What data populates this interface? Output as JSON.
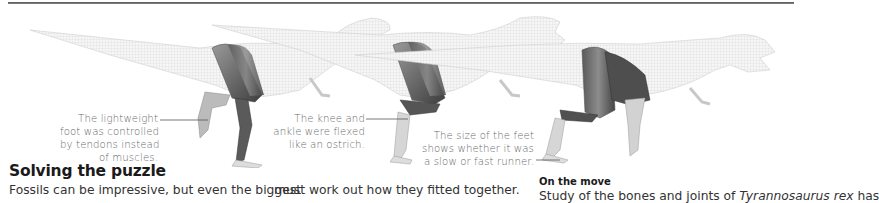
{
  "page": {
    "illustration": {
      "subject": "Tyrannosaurus rex leg musculature, three stride poses",
      "colors": {
        "wireframe": "#c8c8c8",
        "muscle_dark": "#4a4a4a",
        "muscle_light": "#8a8a8a",
        "bone": "#e6e6e6",
        "leader_line": "#555555"
      }
    },
    "callouts": [
      {
        "lines": [
          "The lightweight",
          "foot was controlled",
          "by tendons instead",
          "of muscles."
        ]
      },
      {
        "lines": [
          "The knee and",
          "ankle were flexed",
          "like an ostrich."
        ]
      },
      {
        "lines": [
          "The size of the feet",
          "shows whether it was",
          "a slow or fast runner."
        ]
      }
    ],
    "section": {
      "heading": "Solving the puzzle",
      "body_col1": "Fossils can be impressive, but even the biggest",
      "body_col2": "must work out how they fitted together.",
      "subheading": "On the move",
      "body_col3_prefix": "Study of the bones and joints of ",
      "body_col3_italic": "Tyrannosaurus rex",
      "body_col3_suffix": " has"
    }
  }
}
